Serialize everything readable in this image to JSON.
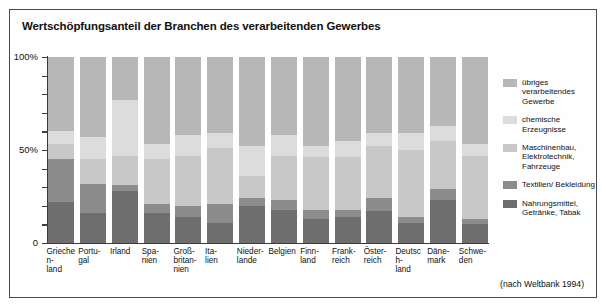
{
  "title": "Wertschöpfungsanteil der Branchen des verarbeitenden Gewerbes",
  "source": "(nach Weltbank 1994)",
  "axis": {
    "y_ticks_labeled": [
      "100%",
      "50%",
      "0"
    ],
    "y_tick_values": [
      100,
      90,
      80,
      70,
      60,
      50,
      40,
      30,
      20,
      10,
      0
    ]
  },
  "legend": {
    "items": [
      {
        "label": "übriges verarbeitendes Gewerbe",
        "color": "#b7b7b7"
      },
      {
        "label": "chemische Erzeugnisse",
        "color": "#dcdcdc"
      },
      {
        "label": "Maschinenbau, Elektrotechnik, Fahrzeuge",
        "color": "#c8c8c8"
      },
      {
        "label": "Textilien/ Bekleidung",
        "color": "#8c8c8c"
      },
      {
        "label": "Nahrungsmittel, Getränke, Tabak",
        "color": "#6e6e6e"
      }
    ]
  },
  "chart_data": {
    "type": "bar",
    "stacked": true,
    "title": "Wertschöpfungsanteil der Branchen des verarbeitenden Gewerbes",
    "xlabel": "",
    "ylabel": "",
    "ylim": [
      0,
      100
    ],
    "grid": false,
    "legend_position": "right",
    "annotations": [
      "(nach Weltbank 1994)"
    ],
    "categories": [
      "Griechen-land",
      "Portu-gal",
      "Irland",
      "Spa-nien",
      "Groß-britan-nien",
      "Ita-lien",
      "Nieder-lande",
      "Belgien",
      "Finn-land",
      "Frank-reich",
      "Öster-reich",
      "Deutsch-land",
      "Däne-mark",
      "Schwe-den"
    ],
    "series": [
      {
        "name": "Nahrungsmittel, Getränke, Tabak",
        "color": "#6e6e6e",
        "values": [
          22,
          16,
          28,
          16,
          14,
          11,
          20,
          18,
          13,
          14,
          17,
          11,
          23,
          10
        ]
      },
      {
        "name": "Textilien/ Bekleidung",
        "color": "#8c8c8c",
        "values": [
          23,
          16,
          3,
          5,
          6,
          10,
          4,
          5,
          5,
          4,
          7,
          3,
          6,
          3
        ]
      },
      {
        "name": "Maschinenbau, Elektrotechnik, Fahrzeuge",
        "color": "#c8c8c8",
        "values": [
          8,
          13,
          16,
          24,
          27,
          30,
          12,
          24,
          28,
          28,
          28,
          36,
          26,
          34
        ]
      },
      {
        "name": "chemische Erzeugnisse",
        "color": "#dcdcdc",
        "values": [
          7,
          12,
          30,
          8,
          11,
          8,
          16,
          11,
          6,
          9,
          7,
          9,
          8,
          6
        ]
      },
      {
        "name": "übriges verarbeitendes Gewerbe",
        "color": "#b7b7b7",
        "values": [
          40,
          43,
          23,
          47,
          42,
          41,
          48,
          42,
          48,
          45,
          41,
          41,
          37,
          47
        ]
      }
    ]
  }
}
